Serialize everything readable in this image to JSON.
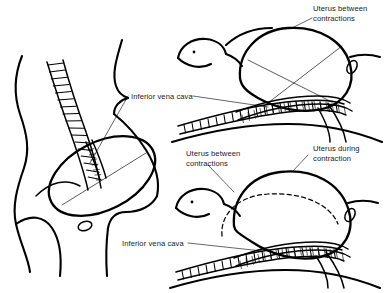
{
  "figure": {
    "background_color": "#ffffff",
    "ink_color": "#000000",
    "label_color": "#1a1a1a"
  },
  "labels": {
    "uterus_between_top": "Uterus between\ncontractions",
    "vena_cava_left": "Inferior vena cava",
    "uterus_between_mid": "Uterus between\ncontractions",
    "uterus_during": "Uterus during\ncontraction",
    "vena_cava_bottom": "Inferior vena cava"
  },
  "panels": [
    {
      "id": "panel-standing",
      "name": "lateral-standing-view",
      "description": "Lateral view of pregnant torso showing vertebral column, gravid uterus and compressed inferior vena cava",
      "labels": [
        "Inferior vena cava"
      ]
    },
    {
      "id": "panel-supine-between",
      "name": "supine-between-contractions-view",
      "description": "Supine woman, head at left, uterus between contractions resting on vertebral column compressing the inferior vena cava",
      "labels": [
        "Uterus between contractions",
        "Inferior vena cava"
      ]
    },
    {
      "id": "panel-supine-during",
      "name": "supine-during-contraction-view",
      "description": "Supine woman, uterus during contraction drawn solid with dashed outline showing position between contractions",
      "labels": [
        "Uterus between contractions",
        "Uterus during contraction",
        "Inferior vena cava"
      ]
    }
  ],
  "icons": {
    "eye": "eye-dot-icon",
    "navel": "navel-oval-icon"
  }
}
